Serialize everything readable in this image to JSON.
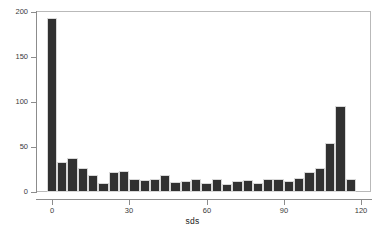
{
  "chart_data": {
    "type": "bar",
    "title": "",
    "subtitle": "",
    "xlabel": "sds",
    "ylabel": "",
    "xlim": [
      -2,
      120
    ],
    "ylim": [
      0,
      200
    ],
    "grid": false,
    "legend": null,
    "bin_width": 4,
    "bin_starts": [
      -2,
      2,
      6,
      10,
      14,
      18,
      22,
      26,
      30,
      34,
      38,
      42,
      46,
      50,
      54,
      58,
      62,
      66,
      70,
      74,
      78,
      82,
      86,
      90,
      94,
      98,
      102,
      106,
      110,
      114
    ],
    "categories": [
      "-2",
      "2",
      "6",
      "10",
      "14",
      "18",
      "22",
      "26",
      "30",
      "34",
      "38",
      "42",
      "46",
      "50",
      "54",
      "58",
      "62",
      "66",
      "70",
      "74",
      "78",
      "82",
      "86",
      "90",
      "94",
      "98",
      "102",
      "106",
      "110",
      "114"
    ],
    "values": [
      193,
      33,
      38,
      27,
      19,
      10,
      22,
      23,
      15,
      13,
      14,
      19,
      11,
      12,
      15,
      10,
      14,
      9,
      12,
      13,
      10,
      15,
      15,
      12,
      16,
      22,
      27,
      55,
      96,
      14
    ],
    "x_ticks": [
      0,
      30,
      60,
      90,
      120
    ],
    "x_tick_labels": [
      "0",
      "30",
      "60",
      "90",
      "120"
    ],
    "y_ticks": [
      0,
      50,
      100,
      150,
      200
    ],
    "y_tick_labels": [
      "0",
      "50",
      "100",
      "150",
      "200"
    ],
    "colors": {
      "bar_fill": "#313131",
      "bar_edge": "#d8d8d8",
      "axis": "#8c8c8c",
      "frame": "#b9b9b9",
      "text": "#3a3a3a",
      "background": "#ffffff"
    }
  }
}
